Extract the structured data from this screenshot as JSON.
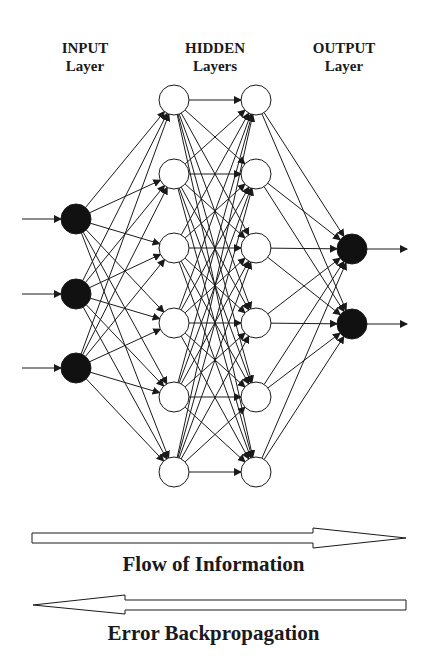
{
  "layers": {
    "input": {
      "title": "INPUT",
      "subtitle": "Layer",
      "node_count": 3,
      "node_fill": "#111111"
    },
    "hidden": {
      "title": "HIDDEN",
      "subtitle": "Layers",
      "layer_count": 2,
      "nodes_per_layer": 6,
      "node_fill": "#ffffff"
    },
    "output": {
      "title": "OUTPUT",
      "subtitle": "Layer",
      "node_count": 2,
      "node_fill": "#111111"
    }
  },
  "arrows": {
    "forward": {
      "label": "Flow of Information",
      "direction": "right"
    },
    "backward": {
      "label": "Error Backpropagation",
      "direction": "left"
    }
  },
  "colors": {
    "line": "#1a1a1a",
    "background": "#ffffff"
  }
}
